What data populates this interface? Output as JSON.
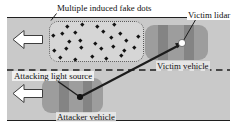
{
  "labels": {
    "fake_dots": "Multiple induced fake dots",
    "victim_lidar": "Victim lidar",
    "victim_vehicle": "Victim vehicle",
    "attacking_light_source": "Attacking light source",
    "attacker_vehicle": "Attacker vehicle"
  },
  "colors": {
    "road": "#c9c9c9",
    "fake_region": "#d6d6d6",
    "vehicle_body": "#9d9d9d",
    "vehicle_window": "#848484",
    "line": "#1c1c1c",
    "lidar_dot": "#ffffff",
    "attack_dot": "#121212",
    "arrow_fill": "#ffffff"
  },
  "travel_direction": "left",
  "fake_dot_points": [
    [
      67,
      26
    ],
    [
      82,
      24
    ],
    [
      97,
      26
    ],
    [
      114,
      24
    ],
    [
      53,
      35
    ],
    [
      62,
      33
    ],
    [
      75,
      32
    ],
    [
      103,
      31
    ],
    [
      120,
      33
    ],
    [
      138,
      36
    ],
    [
      69,
      41
    ],
    [
      80,
      40
    ],
    [
      95,
      43
    ],
    [
      111,
      37
    ],
    [
      126,
      40
    ],
    [
      54,
      50
    ],
    [
      66,
      48
    ],
    [
      81,
      47
    ],
    [
      101,
      48
    ],
    [
      113,
      46
    ],
    [
      124,
      50
    ],
    [
      134,
      47
    ],
    [
      60,
      57
    ],
    [
      75,
      59
    ],
    [
      92,
      56
    ],
    [
      106,
      58
    ],
    [
      121,
      55
    ]
  ]
}
